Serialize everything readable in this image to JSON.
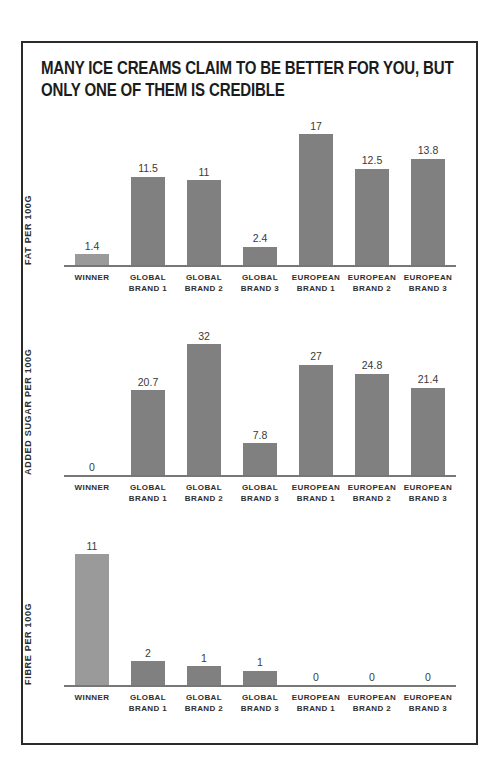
{
  "poster": {
    "title_lines": [
      "MANY ICE CREAMS CLAIM TO BE BETTER FOR YOU, BUT",
      "ONLY ONE OF THEM IS CREDIBLE"
    ],
    "border_color": "#2b2b2b",
    "background_color": "#ffffff"
  },
  "colors": {
    "bar_standard": "#808080",
    "bar_winner": "#9a9a9a",
    "axis": "#777777",
    "text": "#2e2e2e"
  },
  "chart_data": [
    {
      "type": "bar",
      "title": "",
      "ylabel": "FAT PER 100G",
      "xlabel": "",
      "categories": [
        "WINNER",
        "GLOBAL BRAND 1",
        "GLOBAL BRAND 2",
        "GLOBAL BRAND 3",
        "EUROPEAN BRAND 1",
        "EUROPEAN BRAND 2",
        "EUROPEAN BRAND 3"
      ],
      "category_lines": [
        [
          "WINNER",
          ""
        ],
        [
          "GLOBAL",
          "BRAND 1"
        ],
        [
          "GLOBAL",
          "BRAND 2"
        ],
        [
          "GLOBAL",
          "BRAND 3"
        ],
        [
          "EUROPEAN",
          "BRAND 1"
        ],
        [
          "EUROPEAN",
          "BRAND 2"
        ],
        [
          "EUROPEAN",
          "BRAND 3"
        ]
      ],
      "values": [
        1.4,
        11.5,
        11,
        2.4,
        17,
        12.5,
        13.8
      ],
      "value_labels": [
        "1.4",
        "11.5",
        "11",
        "2.4",
        "17",
        "12.5",
        "13.8"
      ],
      "highlight_index": 0,
      "ylim": [
        0,
        17
      ],
      "grid": false,
      "legend": "none"
    },
    {
      "type": "bar",
      "title": "",
      "ylabel": "ADDED SUGAR PER 100G",
      "xlabel": "",
      "categories": [
        "WINNER",
        "GLOBAL BRAND 1",
        "GLOBAL BRAND 2",
        "GLOBAL BRAND 3",
        "EUROPEAN BRAND 1",
        "EUROPEAN BRAND 2",
        "EUROPEAN BRAND 3"
      ],
      "category_lines": [
        [
          "WINNER",
          ""
        ],
        [
          "GLOBAL",
          "BRAND 1"
        ],
        [
          "GLOBAL",
          "BRAND 2"
        ],
        [
          "GLOBAL",
          "BRAND 3"
        ],
        [
          "EUROPEAN",
          "BRAND 1"
        ],
        [
          "EUROPEAN",
          "BRAND 2"
        ],
        [
          "EUROPEAN",
          "BRAND 3"
        ]
      ],
      "values": [
        0,
        20.7,
        32,
        7.8,
        27,
        24.8,
        21.4
      ],
      "value_labels": [
        "0",
        "20.7",
        "32",
        "7.8",
        "27",
        "24.8",
        "21.4"
      ],
      "highlight_index": 0,
      "ylim": [
        0,
        32
      ],
      "grid": false,
      "legend": "none"
    },
    {
      "type": "bar",
      "title": "",
      "ylabel": "FIBRE PER 100G",
      "xlabel": "",
      "categories": [
        "WINNER",
        "GLOBAL BRAND 1",
        "GLOBAL BRAND 2",
        "GLOBAL BRAND 3",
        "EUROPEAN BRAND 1",
        "EUROPEAN BRAND 2",
        "EUROPEAN BRAND 3"
      ],
      "category_lines": [
        [
          "WINNER",
          ""
        ],
        [
          "GLOBAL",
          "BRAND 1"
        ],
        [
          "GLOBAL",
          "BRAND 2"
        ],
        [
          "GLOBAL",
          "BRAND 3"
        ],
        [
          "EUROPEAN",
          "BRAND 1"
        ],
        [
          "EUROPEAN",
          "BRAND 2"
        ],
        [
          "EUROPEAN",
          "BRAND 3"
        ]
      ],
      "values": [
        11,
        2,
        1.6,
        1.2,
        0,
        0,
        0
      ],
      "value_labels": [
        "11",
        "2",
        "1",
        "1",
        "0",
        "0",
        "0"
      ],
      "highlight_index": 0,
      "ylim": [
        0,
        11
      ],
      "grid": false,
      "legend": "none"
    }
  ]
}
